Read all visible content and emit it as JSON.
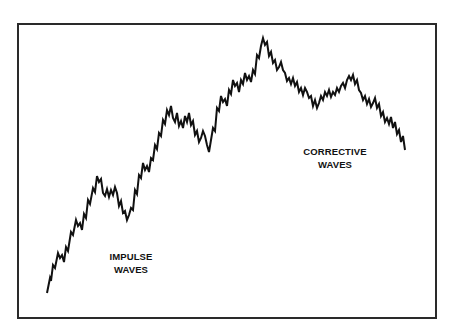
{
  "diagram": {
    "title": "",
    "frame": {
      "border_color": "#2a2a2a",
      "background": "#ffffff"
    },
    "line_color": "#111111",
    "labels": {
      "impulse": {
        "line1": "IMPULSE",
        "line2": "WAVES"
      },
      "corrective": {
        "line1": "CORRECTIVE",
        "line2": "WAVES"
      }
    }
  },
  "chart_data": {
    "type": "line",
    "title": "",
    "xlabel": "",
    "ylabel": "",
    "grid": false,
    "legend": null,
    "annotations": [
      {
        "text": "IMPULSE WAVES",
        "position": "lower-left, under rising segment"
      },
      {
        "text": "CORRECTIVE WAVES",
        "position": "right, under declining segment"
      }
    ],
    "points_px": [
      [
        47,
        293
      ],
      [
        50,
        278
      ],
      [
        51,
        281
      ],
      [
        53,
        265
      ],
      [
        55,
        268
      ],
      [
        58,
        253
      ],
      [
        60,
        258
      ],
      [
        62,
        255
      ],
      [
        64,
        262
      ],
      [
        66,
        247
      ],
      [
        68,
        251
      ],
      [
        71,
        232
      ],
      [
        73,
        235
      ],
      [
        76,
        220
      ],
      [
        78,
        226
      ],
      [
        80,
        223
      ],
      [
        82,
        230
      ],
      [
        84,
        214
      ],
      [
        86,
        218
      ],
      [
        88,
        200
      ],
      [
        90,
        204
      ],
      [
        93,
        188
      ],
      [
        95,
        192
      ],
      [
        97,
        176
      ],
      [
        99,
        182
      ],
      [
        101,
        179
      ],
      [
        103,
        193
      ],
      [
        105,
        196
      ],
      [
        107,
        189
      ],
      [
        109,
        197
      ],
      [
        111,
        190
      ],
      [
        113,
        195
      ],
      [
        115,
        187
      ],
      [
        117,
        193
      ],
      [
        119,
        206
      ],
      [
        121,
        201
      ],
      [
        123,
        213
      ],
      [
        125,
        211
      ],
      [
        127,
        220
      ],
      [
        129,
        215
      ],
      [
        131,
        208
      ],
      [
        133,
        210
      ],
      [
        135,
        190
      ],
      [
        137,
        194
      ],
      [
        139,
        175
      ],
      [
        141,
        178
      ],
      [
        143,
        163
      ],
      [
        145,
        170
      ],
      [
        147,
        166
      ],
      [
        149,
        172
      ],
      [
        151,
        158
      ],
      [
        153,
        160
      ],
      [
        155,
        145
      ],
      [
        157,
        149
      ],
      [
        159,
        133
      ],
      [
        161,
        136
      ],
      [
        163,
        120
      ],
      [
        165,
        124
      ],
      [
        167,
        110
      ],
      [
        169,
        115
      ],
      [
        171,
        106
      ],
      [
        173,
        118
      ],
      [
        175,
        122
      ],
      [
        177,
        113
      ],
      [
        179,
        126
      ],
      [
        181,
        121
      ],
      [
        183,
        128
      ],
      [
        185,
        116
      ],
      [
        187,
        122
      ],
      [
        189,
        113
      ],
      [
        191,
        125
      ],
      [
        193,
        121
      ],
      [
        195,
        135
      ],
      [
        197,
        131
      ],
      [
        199,
        142
      ],
      [
        201,
        138
      ],
      [
        203,
        131
      ],
      [
        205,
        136
      ],
      [
        207,
        145
      ],
      [
        209,
        152
      ],
      [
        211,
        140
      ],
      [
        213,
        128
      ],
      [
        215,
        131
      ],
      [
        217,
        108
      ],
      [
        219,
        111
      ],
      [
        221,
        96
      ],
      [
        223,
        102
      ],
      [
        225,
        99
      ],
      [
        227,
        106
      ],
      [
        229,
        90
      ],
      [
        231,
        94
      ],
      [
        233,
        80
      ],
      [
        235,
        86
      ],
      [
        237,
        83
      ],
      [
        239,
        92
      ],
      [
        241,
        80
      ],
      [
        243,
        84
      ],
      [
        245,
        73
      ],
      [
        247,
        80
      ],
      [
        249,
        76
      ],
      [
        251,
        82
      ],
      [
        253,
        70
      ],
      [
        255,
        74
      ],
      [
        257,
        55
      ],
      [
        259,
        58
      ],
      [
        261,
        46
      ],
      [
        263,
        38
      ],
      [
        265,
        45
      ],
      [
        267,
        42
      ],
      [
        269,
        56
      ],
      [
        271,
        52
      ],
      [
        273,
        63
      ],
      [
        275,
        60
      ],
      [
        277,
        70
      ],
      [
        279,
        67
      ],
      [
        281,
        62
      ],
      [
        283,
        70
      ],
      [
        285,
        73
      ],
      [
        287,
        81
      ],
      [
        289,
        78
      ],
      [
        291,
        84
      ],
      [
        293,
        78
      ],
      [
        295,
        86
      ],
      [
        297,
        82
      ],
      [
        299,
        92
      ],
      [
        301,
        88
      ],
      [
        303,
        95
      ],
      [
        305,
        88
      ],
      [
        307,
        92
      ],
      [
        309,
        98
      ],
      [
        311,
        96
      ],
      [
        313,
        106
      ],
      [
        315,
        100
      ],
      [
        317,
        108
      ],
      [
        319,
        103
      ],
      [
        321,
        96
      ],
      [
        323,
        100
      ],
      [
        325,
        92
      ],
      [
        327,
        96
      ],
      [
        329,
        90
      ],
      [
        331,
        97
      ],
      [
        333,
        92
      ],
      [
        335,
        95
      ],
      [
        337,
        88
      ],
      [
        339,
        92
      ],
      [
        341,
        86
      ],
      [
        343,
        83
      ],
      [
        345,
        88
      ],
      [
        347,
        80
      ],
      [
        349,
        76
      ],
      [
        351,
        80
      ],
      [
        353,
        75
      ],
      [
        355,
        84
      ],
      [
        357,
        80
      ],
      [
        359,
        90
      ],
      [
        361,
        93
      ],
      [
        363,
        100
      ],
      [
        365,
        96
      ],
      [
        367,
        104
      ],
      [
        369,
        99
      ],
      [
        371,
        107
      ],
      [
        373,
        103
      ],
      [
        375,
        98
      ],
      [
        377,
        108
      ],
      [
        379,
        104
      ],
      [
        381,
        116
      ],
      [
        383,
        112
      ],
      [
        385,
        122
      ],
      [
        387,
        118
      ],
      [
        389,
        124
      ],
      [
        391,
        117
      ],
      [
        393,
        128
      ],
      [
        395,
        122
      ],
      [
        397,
        134
      ],
      [
        399,
        130
      ],
      [
        401,
        142
      ],
      [
        403,
        136
      ],
      [
        405,
        150
      ]
    ],
    "key_points": {
      "start": [
        47,
        293
      ],
      "impulse_peak": [
        263,
        38
      ],
      "corrective_secondary_peak": [
        353,
        75
      ],
      "end": [
        405,
        150
      ]
    }
  }
}
